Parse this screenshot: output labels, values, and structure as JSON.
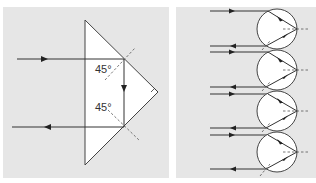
{
  "figure": {
    "left_panel": {
      "description": "Right-angle prism retroreflector with two total internal reflections",
      "angle_labels": [
        "45°",
        "45°"
      ],
      "right_angle_marker": true,
      "incoming_ray_y": 59,
      "outgoing_ray_y": 127
    },
    "right_panel": {
      "description": "Array of spherical retroreflectors (glass beads) returning incident rays",
      "sphere_count": 4
    },
    "colors": {
      "panel_bg": "#e6e6e6",
      "shape_fill": "#ffffff",
      "line": "#333333"
    }
  }
}
